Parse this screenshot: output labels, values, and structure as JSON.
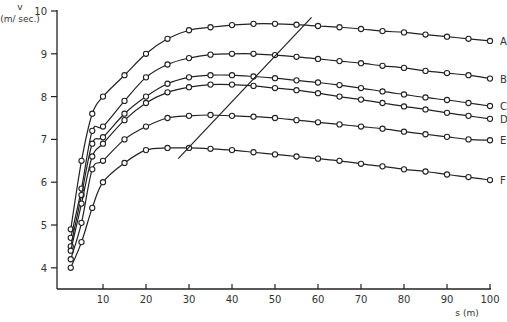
{
  "chart_data": {
    "type": "line",
    "title": "",
    "xlabel": "s (m)",
    "ylabel_top": "v",
    "ylabel_unit": "(m/ sec.)",
    "xlim": [
      0,
      100
    ],
    "ylim": [
      3.5,
      10
    ],
    "x_ticks": [
      10,
      20,
      30,
      40,
      50,
      60,
      70,
      80,
      90,
      100
    ],
    "y_ticks": [
      4,
      5,
      6,
      7,
      8,
      9,
      10
    ],
    "grid": false,
    "legend": "inline labels at right end of each curve",
    "x": [
      2.5,
      5,
      7.5,
      10,
      15,
      20,
      25,
      30,
      35,
      40,
      45,
      50,
      55,
      60,
      65,
      70,
      75,
      80,
      85,
      90,
      95,
      100
    ],
    "series": [
      {
        "name": "A",
        "values": [
          4.9,
          6.5,
          7.6,
          8.0,
          8.5,
          9.0,
          9.35,
          9.55,
          9.62,
          9.67,
          9.7,
          9.7,
          9.68,
          9.65,
          9.62,
          9.58,
          9.53,
          9.5,
          9.45,
          9.4,
          9.35,
          9.3
        ]
      },
      {
        "name": "B",
        "values": [
          4.7,
          5.85,
          7.2,
          7.3,
          7.9,
          8.45,
          8.75,
          8.9,
          8.98,
          9.0,
          9.0,
          8.97,
          8.93,
          8.88,
          8.83,
          8.78,
          8.72,
          8.67,
          8.6,
          8.55,
          8.5,
          8.42
        ]
      },
      {
        "name": "C",
        "values": [
          4.5,
          5.7,
          6.9,
          7.05,
          7.6,
          8.0,
          8.3,
          8.45,
          8.5,
          8.5,
          8.47,
          8.43,
          8.38,
          8.33,
          8.27,
          8.2,
          8.12,
          8.05,
          7.98,
          7.92,
          7.85,
          7.78
        ]
      },
      {
        "name": "D",
        "values": [
          4.4,
          5.5,
          6.6,
          6.9,
          7.45,
          7.85,
          8.1,
          8.22,
          8.28,
          8.28,
          8.25,
          8.2,
          8.15,
          8.08,
          8.0,
          7.93,
          7.85,
          7.77,
          7.7,
          7.62,
          7.55,
          7.48
        ]
      },
      {
        "name": "E",
        "values": [
          4.2,
          5.05,
          6.3,
          6.5,
          7.0,
          7.3,
          7.5,
          7.55,
          7.57,
          7.55,
          7.53,
          7.5,
          7.45,
          7.4,
          7.35,
          7.3,
          7.25,
          7.18,
          7.12,
          7.06,
          7.0,
          6.98
        ]
      },
      {
        "name": "F",
        "values": [
          4.0,
          4.6,
          5.4,
          6.0,
          6.45,
          6.75,
          6.8,
          6.8,
          6.78,
          6.75,
          6.7,
          6.65,
          6.6,
          6.55,
          6.5,
          6.43,
          6.37,
          6.3,
          6.25,
          6.18,
          6.12,
          6.05
        ]
      }
    ],
    "annotations": [
      {
        "type": "line",
        "description": "diagonal line through curve maxima",
        "from": [
          27.5,
          6.55
        ],
        "to": [
          58.5,
          9.85
        ]
      }
    ]
  },
  "axes": {
    "y_label_v": "v",
    "y_label_unit": "(m/ sec.)",
    "x_label": "s (m)"
  }
}
